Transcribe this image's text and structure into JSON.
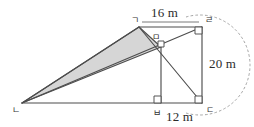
{
  "figure": {
    "background_color": "#ffffff",
    "line_color": "#4d4d4d",
    "shade_color": "#d6d6d6",
    "arc_color": "#9a9a9a",
    "dimensions": {
      "top_length": "16 m",
      "right_length": "20 m",
      "bottom_length": "12 m"
    },
    "vertices": {
      "giyeok": "ㄱ",
      "nieun": "ㄴ",
      "digeut": "ㄷ",
      "rieul": "ㄹ",
      "mieum": "ㅁ",
      "bieup": "ㅂ"
    },
    "vertex_points": {
      "giyeok": [
        139,
        27
      ],
      "rieul": [
        202,
        27
      ],
      "digeut": [
        202,
        103
      ],
      "nieun": [
        22,
        103
      ],
      "bieup": [
        161,
        103
      ],
      "mieum": [
        161,
        47
      ]
    },
    "right_angles": [
      "rieul",
      "digeut",
      "bieup",
      "mieum"
    ],
    "shaded_region": [
      "nieun",
      "giyeok",
      "mieum"
    ],
    "segments": [
      [
        "giyeok",
        "rieul"
      ],
      [
        "rieul",
        "digeut"
      ],
      [
        "digeut",
        "nieun"
      ],
      [
        "nieun",
        "giyeok"
      ],
      [
        "giyeok",
        "digeut"
      ],
      [
        "nieun",
        "mieum"
      ],
      [
        "mieum",
        "bieup"
      ]
    ],
    "arc": {
      "description": "dashed arc from giyeok-side sweeping past rieul and digeut",
      "style": "dashed"
    }
  }
}
